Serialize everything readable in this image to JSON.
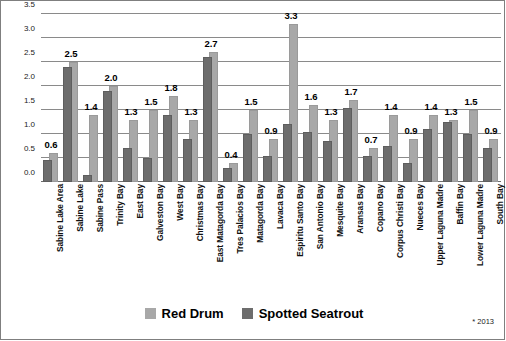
{
  "chart_data": {
    "type": "bar",
    "title": "",
    "subtitle": "",
    "xlabel": "",
    "ylabel": "",
    "ylim": [
      0.0,
      3.5
    ],
    "ytick_labels": [
      "0.0",
      "0.5",
      "1.0",
      "1.5",
      "2.0",
      "2.5",
      "3.0",
      "3.5"
    ],
    "ytick_values": [
      0.0,
      0.5,
      1.0,
      1.5,
      2.0,
      2.5,
      3.0,
      3.5
    ],
    "grid": true,
    "legend_position": "bottom",
    "annotation": "* 2013",
    "categories": [
      "Sabine Lake Area",
      "Sabine Lake",
      "Sabine Pass",
      "Trinity Bay",
      "East Bay",
      "Galveston Bay",
      "West Bay",
      "Christmas Bay",
      "East Matagorda Bay",
      "Tres Palacios Bay",
      "Matagorda Bay",
      "Lavaca Bay",
      "Espiritu Santo Bay",
      "San Antonio Bay",
      "Mesquite Bay",
      "Aransas Bay",
      "Copano Bay",
      "Corpus Christi Bay",
      "Nueces Bay",
      "Upper Laguna Madre",
      "Baffin Bay",
      "Lower Laguna Madre",
      "South Bay"
    ],
    "series": [
      {
        "name": "Red Drum",
        "color": "#a8a8a8",
        "values": [
          0.6,
          2.5,
          1.4,
          2.0,
          1.3,
          1.5,
          1.8,
          1.3,
          2.7,
          0.4,
          1.5,
          0.9,
          3.3,
          1.6,
          1.3,
          1.7,
          0.7,
          1.4,
          0.9,
          1.4,
          1.3,
          1.5,
          0.9
        ],
        "labels": [
          "0.6",
          "2.5",
          "1.4",
          "2.0",
          "1.3",
          "1.5",
          "1.8",
          "1.3",
          "2.7",
          "0.4",
          "1.5",
          "0.9",
          "3.3",
          "1.6",
          "1.3",
          "1.7",
          "0.7",
          "1.4",
          "0.9",
          "1.4",
          "1.3",
          "1.5",
          "0.9"
        ]
      },
      {
        "name": "Spotted Seatrout",
        "color": "#6d6d6d",
        "values": [
          0.45,
          2.4,
          0.15,
          1.9,
          0.7,
          0.5,
          1.4,
          0.9,
          2.6,
          0.3,
          1.0,
          0.55,
          1.2,
          1.05,
          0.85,
          1.55,
          0.55,
          0.75,
          0.4,
          1.1,
          1.25,
          1.0,
          0.7
        ]
      }
    ]
  },
  "legend": {
    "items": [
      {
        "label": "Red Drum",
        "swatch": "light-grey-swatch"
      },
      {
        "label": "Spotted Seatrout",
        "swatch": "dark-grey-swatch"
      }
    ]
  },
  "footnote": "* 2013"
}
